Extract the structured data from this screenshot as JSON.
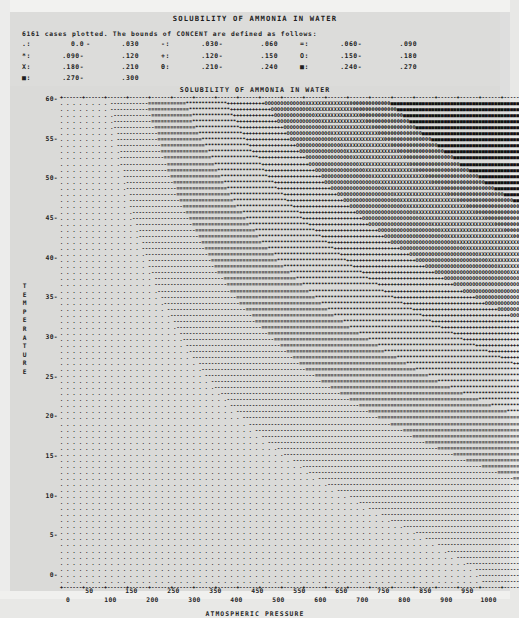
{
  "document": {
    "main_title": "SOLUBILITY OF AMMONIA IN WATER",
    "plot_title": "SOLUBILITY OF AMMONIA IN WATER",
    "cases_line": "6161 cases plotted. The bounds of CONCENT are defined as follows:"
  },
  "legend": {
    "variable": "CONCENT",
    "rows": [
      [
        {
          "symbol": ".:",
          "low": "0.0",
          "dash": "-",
          "high": ".030"
        },
        {
          "symbol": "-:",
          "low": ".030-",
          "dash": "",
          "high": ".060"
        },
        {
          "symbol": "=:",
          "low": ".060-",
          "dash": "",
          "high": ".090"
        }
      ],
      [
        {
          "symbol": "*:",
          "low": ".090-",
          "dash": "",
          "high": ".120"
        },
        {
          "symbol": "+:",
          "low": ".120-",
          "dash": "",
          "high": ".150"
        },
        {
          "symbol": "O:",
          "low": ".150-",
          "dash": "",
          "high": ".180"
        }
      ],
      [
        {
          "symbol": "X:",
          "low": ".180-",
          "dash": "",
          "high": ".210"
        },
        {
          "symbol": "Θ:",
          "low": ".210-",
          "dash": "",
          "high": ".240"
        },
        {
          "symbol": "■:",
          "low": ".240-",
          "dash": "",
          "high": ".270"
        }
      ],
      [
        {
          "symbol": "■:",
          "low": ".270-",
          "dash": "",
          "high": ".300"
        }
      ]
    ]
  },
  "chart_data": {
    "type": "heatmap",
    "title": "SOLUBILITY OF AMMONIA IN WATER",
    "xlabel": "ATMOSPHERIC PRESSURE",
    "ylabel": "TEMPERATURE",
    "xlim": [
      0,
      1000
    ],
    "ylim": [
      0,
      60
    ],
    "grid": false,
    "legend_position": "top",
    "n_cases": 6161,
    "value_variable": "CONCENT",
    "x_ticks": [
      0,
      50,
      100,
      150,
      200,
      250,
      300,
      350,
      400,
      450,
      500,
      550,
      600,
      650,
      700,
      750,
      800,
      850,
      900,
      950,
      1000
    ],
    "y_ticks": [
      0,
      5,
      10,
      15,
      20,
      25,
      30,
      35,
      40,
      45,
      50,
      55,
      60
    ],
    "bands": [
      {
        "symbol": ".",
        "range": [
          0.0,
          0.03
        ]
      },
      {
        "symbol": "-",
        "range": [
          0.03,
          0.06
        ]
      },
      {
        "symbol": "=",
        "range": [
          0.06,
          0.09
        ]
      },
      {
        "symbol": "*",
        "range": [
          0.09,
          0.12
        ]
      },
      {
        "symbol": "+",
        "range": [
          0.12,
          0.15
        ]
      },
      {
        "symbol": "O",
        "range": [
          0.15,
          0.18
        ]
      },
      {
        "symbol": "X",
        "range": [
          0.18,
          0.21
        ]
      },
      {
        "symbol": "Θ",
        "range": [
          0.21,
          0.24
        ]
      },
      {
        "symbol": "■",
        "range": [
          0.24,
          0.3
        ]
      }
    ]
  },
  "axes": {
    "y_label_letters": [
      "T",
      "E",
      "M",
      "P",
      "E",
      "R",
      "A",
      "T",
      "U",
      "R",
      "E"
    ],
    "y_tick_labels": [
      "60-",
      "55-",
      "50-",
      "45-",
      "40-",
      "35-",
      "30-",
      "25-",
      "20-",
      "15-",
      "10-",
      "5-",
      "0-"
    ],
    "x_tick_labels_upper": [
      "50",
      "150",
      "250",
      "350",
      "450",
      "550",
      "650",
      "750",
      "850",
      "950"
    ],
    "x_tick_labels_lower": [
      "0",
      "100",
      "200",
      "300",
      "400",
      "500",
      "600",
      "700",
      "800",
      "900",
      "1000"
    ],
    "x_axis_title": "ATMOSPHERIC PRESSURE"
  }
}
